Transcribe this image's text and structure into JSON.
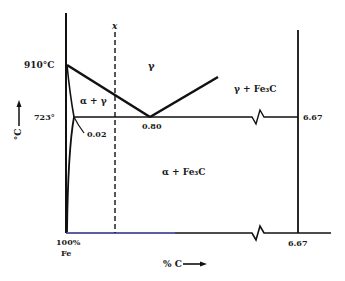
{
  "diagram": {
    "axes": {
      "y_label": "°C",
      "y_arrow": "up",
      "x_label": "% C",
      "x_arrow": "right",
      "origin_label_line1": "100%",
      "origin_label_line2": "Fe"
    },
    "temperatures": {
      "t910": "910°C",
      "t723": "723°"
    },
    "compositions": {
      "c002": "0.02",
      "c080": "0.80",
      "c667_top": "6.67",
      "c667_bottom": "6.67"
    },
    "regions": {
      "gamma": "γ",
      "alpha_gamma": "α + γ",
      "gamma_fe3c": "γ + Fe₃C",
      "alpha_fe3c": "α + Fe₃C"
    },
    "marker": {
      "composition_line_label": "x"
    },
    "colors": {
      "line": "#111111",
      "base_line_tint": "#1f2a8a"
    }
  }
}
